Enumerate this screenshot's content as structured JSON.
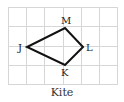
{
  "figure": {
    "caption": "Kite",
    "grid": {
      "cols": 6,
      "rows": 4,
      "color": "#d4d4d4"
    },
    "shape_color": "#111111",
    "vertices": [
      {
        "label": "M",
        "x": 65,
        "y": 28
      },
      {
        "label": "L",
        "x": 83,
        "y": 47
      },
      {
        "label": "K",
        "x": 65,
        "y": 65
      },
      {
        "label": "J",
        "x": 27,
        "y": 47
      }
    ]
  }
}
